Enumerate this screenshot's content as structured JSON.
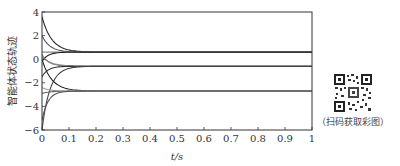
{
  "chart_data": {
    "type": "line",
    "title": "",
    "xlabel": "t/s",
    "ylabel": "智能体状态轨迹",
    "xlim": [
      0,
      1
    ],
    "ylim": [
      -6,
      4
    ],
    "xticks": [
      "0",
      "0.1",
      "0.2",
      "0.3",
      "0.4",
      "0.5",
      "0.6",
      "0.7",
      "0.8",
      "0.9",
      "1"
    ],
    "yticks": [
      "4",
      "2",
      "0",
      "-2",
      "-4",
      "-6"
    ],
    "grid": false,
    "legend": null,
    "steady_states": [
      0.6,
      -0.6,
      -2.7
    ],
    "series": [
      {
        "name": "agent-1",
        "color": "#222222",
        "start": 3.6,
        "final": 0.6
      },
      {
        "name": "agent-2",
        "color": "#555555",
        "start": 2.0,
        "final": 0.6
      },
      {
        "name": "agent-3",
        "color": "#888888",
        "start": 0.6,
        "final": 0.6
      },
      {
        "name": "agent-4",
        "color": "#222222",
        "start": -0.2,
        "final": 0.6
      },
      {
        "name": "agent-5",
        "color": "#999999",
        "start": 0.2,
        "final": -0.6
      },
      {
        "name": "agent-6",
        "color": "#444444",
        "start": -6.0,
        "final": -0.6
      },
      {
        "name": "agent-7",
        "color": "#777777",
        "start": 0.4,
        "final": -0.6
      },
      {
        "name": "agent-8",
        "color": "#333333",
        "start": -1.5,
        "final": -0.6
      },
      {
        "name": "agent-9",
        "color": "#222222",
        "start": 0.0,
        "final": -2.7
      },
      {
        "name": "agent-10",
        "color": "#666666",
        "start": -2.9,
        "final": -2.7
      },
      {
        "name": "agent-11",
        "color": "#999999",
        "start": -2.4,
        "final": -2.7
      },
      {
        "name": "agent-12",
        "color": "#555555",
        "start": -5.2,
        "final": -2.7
      }
    ]
  },
  "qr": {
    "caption": "（扫码获取彩图）"
  }
}
